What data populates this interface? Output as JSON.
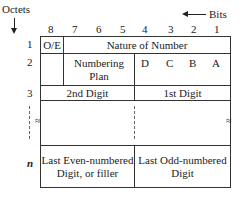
{
  "header": {
    "octets_label": "Octets",
    "bits_label": "Bits",
    "bit_numbers": [
      "8",
      "7",
      "6",
      "5",
      "4",
      "3",
      "2",
      "1"
    ]
  },
  "rows": [
    {
      "octet": "1",
      "cells": [
        "O/E",
        "Nature of Number"
      ]
    },
    {
      "octet": "2",
      "cells": [
        "",
        "Numbering Plan",
        "D",
        "C",
        "B",
        "A"
      ]
    },
    {
      "octet": "3",
      "cells": [
        "2nd Digit",
        "1st Digit"
      ]
    },
    {
      "octet": "",
      "cells": [
        "",
        ""
      ]
    },
    {
      "octet": "n",
      "cells": [
        "Last Even-numbered Digit, or filler",
        "Last Odd-numbered Digit"
      ]
    }
  ],
  "row2": {
    "numbering_line1": "Numbering",
    "numbering_line2": "Plan"
  },
  "rown": {
    "left_line1": "Last Even-numbered",
    "left_line2": "Digit, or filler",
    "right_line1": "Last Odd-numbered",
    "right_line2": "Digit"
  }
}
